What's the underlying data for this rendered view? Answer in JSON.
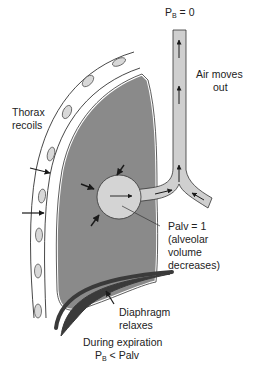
{
  "diagram": {
    "type": "physiology-illustration",
    "labels": {
      "pb_top": "P",
      "pb_top_sub": "B",
      "pb_top_rest": " = 0",
      "air_line1": "Air moves",
      "air_line2": "out",
      "thorax_line1": "Thorax",
      "thorax_line2": "recoils",
      "palv_line1": "Palv = 1",
      "palv_line2": "(alveolar",
      "palv_line3": "volume",
      "palv_line4": "decreases)",
      "diaphragm_line1": "Diaphragm",
      "diaphragm_line2": "relaxes",
      "footer_line1": "During expiration",
      "footer_p": "P",
      "footer_sub": "B",
      "footer_rest": " < Palv"
    },
    "components": [
      "thorax-wall-with-ribs",
      "lung",
      "alveolus",
      "airway-trachea",
      "diaphragm"
    ],
    "colors": {
      "lung": "#8a8a8a",
      "alveolus": "#d4d4d4",
      "airway": "#cfcfcf",
      "rib": "#d8d8d8",
      "diaphragm": "#3a3a3a",
      "stroke": "#333333"
    }
  }
}
